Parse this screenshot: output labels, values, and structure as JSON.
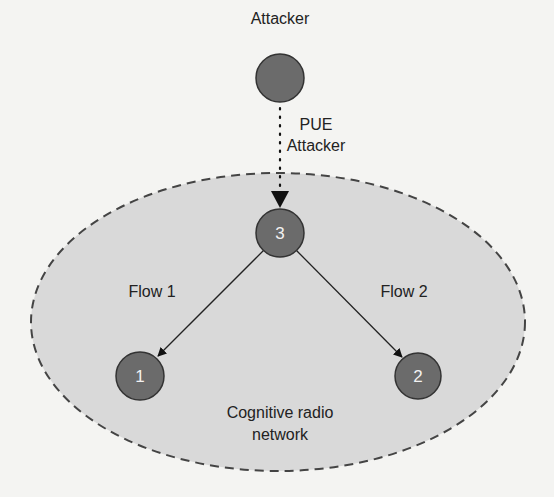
{
  "diagram": {
    "attacker_label": "Attacker",
    "pue_label_line1": "PUE",
    "pue_label_line2": "Attacker",
    "network_label_line1": "Cognitive radio",
    "network_label_line2": "network",
    "flows": [
      {
        "label": "Flow 1",
        "from": "3",
        "to": "1"
      },
      {
        "label": "Flow 2",
        "from": "3",
        "to": "2"
      }
    ],
    "nodes": [
      {
        "id": "attacker",
        "label": ""
      },
      {
        "id": "3",
        "label": "3"
      },
      {
        "id": "1",
        "label": "1"
      },
      {
        "id": "2",
        "label": "2"
      }
    ],
    "colors": {
      "node_fill": "#6b6b6b",
      "node_stroke": "#333333",
      "network_fill": "#d9d9d9",
      "network_stroke": "#444444",
      "background": "#f4f4f2"
    }
  }
}
